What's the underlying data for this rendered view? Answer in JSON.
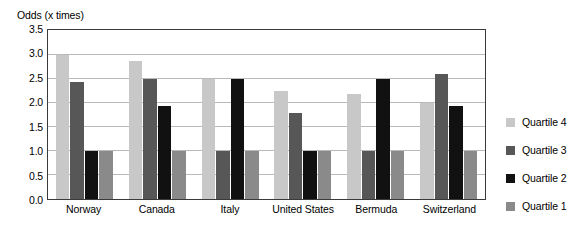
{
  "chart_data": {
    "type": "bar",
    "title": "",
    "xlabel": "",
    "ylabel": "Odds (x times)",
    "ylim": [
      0.0,
      3.5
    ],
    "yticks": [
      "0.0",
      "0.5",
      "1.0",
      "1.5",
      "2.0",
      "2.5",
      "3.0",
      "3.5"
    ],
    "grid": true,
    "legend_position": "right",
    "categories": [
      "Norway",
      "Canada",
      "Italy",
      "United States",
      "Bermuda",
      "Switzerland"
    ],
    "series": [
      {
        "name": "Quartile 4",
        "color": "#c8c8c8",
        "values": [
          3.0,
          2.88,
          2.5,
          2.25,
          2.2,
          2.0
        ]
      },
      {
        "name": "Quartile 3",
        "color": "#575757",
        "values": [
          2.45,
          2.5,
          1.0,
          1.8,
          1.0,
          2.6
        ]
      },
      {
        "name": "Quartile 2",
        "color": "#111111",
        "values": [
          1.0,
          1.95,
          2.5,
          1.0,
          2.5,
          1.95
        ]
      },
      {
        "name": "Quartile 1",
        "color": "#8a8a8a",
        "values": [
          1.0,
          1.0,
          1.0,
          1.0,
          1.0,
          1.0
        ]
      }
    ]
  }
}
